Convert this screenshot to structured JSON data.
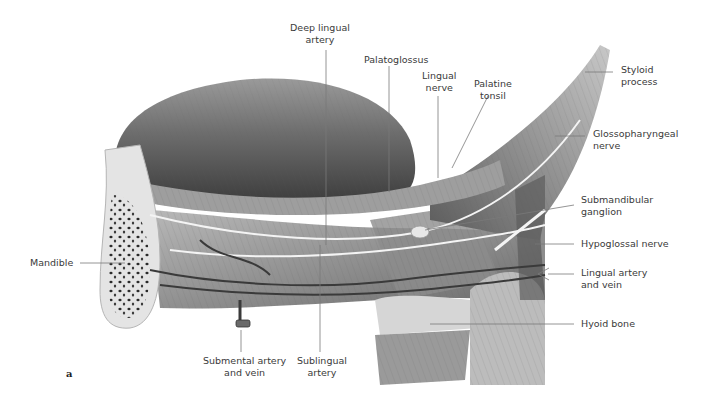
{
  "figure": {
    "panel_letter": "a",
    "labels": {
      "deep_lingual_artery": "Deep lingual\nartery",
      "palatoglossus": "Palatoglossus",
      "lingual_nerve": "Lingual\nnerve",
      "palatine_tonsil": "Palatine\ntonsil",
      "styloid_process": "Styloid\nprocess",
      "glossopharyngeal_nerve": "Glossopharyngeal\nnerve",
      "submandibular_ganglion": "Submandibular\nganglion",
      "hypoglossal_nerve": "Hypoglossal nerve",
      "lingual_artery_vein": "Lingual artery\nand vein",
      "hyoid_bone": "Hyoid bone",
      "mandible": "Mandible",
      "submental_artery_vein": "Submental artery\nand vein",
      "sublingual_artery": "Sublingual\nartery"
    },
    "colors": {
      "background": "#ffffff",
      "label_text": "#3a3a3a",
      "leader_line": "#7a7a7a",
      "tongue_dark": "#4a4a4a",
      "tongue_mid": "#7d7d7d",
      "muscle_light": "#bdbdbd",
      "bone": "#e6e6e6",
      "nerve": "#f2f2f2"
    }
  }
}
